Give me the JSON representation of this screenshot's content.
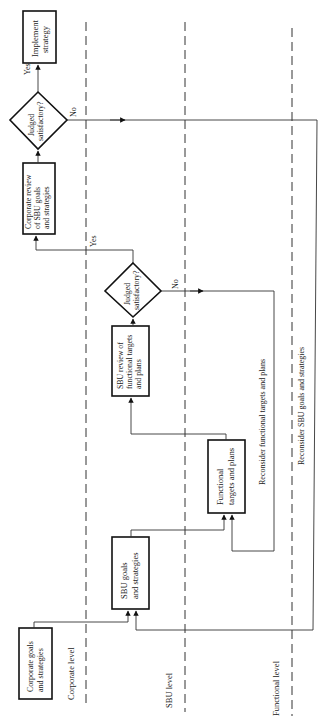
{
  "diagram": {
    "orientation": "rotated-90-ccw",
    "levels": [
      {
        "id": "corporate",
        "label": "Corporate level"
      },
      {
        "id": "sbu",
        "label": "SBU level"
      },
      {
        "id": "functional",
        "label": "Functional level"
      }
    ],
    "nodes": {
      "corporate_goals": {
        "line1": "Corporate goals",
        "line2": "and strategies"
      },
      "sbu_goals": {
        "line1": "SBU goals",
        "line2": "and strategies"
      },
      "functional_targets": {
        "line1": "Functional",
        "line2": "targets and plans"
      },
      "sbu_review": {
        "line1": "SBU review of",
        "line2": "functional targets",
        "line3": "and plans"
      },
      "sbu_decision": {
        "line1": "Judged",
        "line2": "satisfactory?"
      },
      "corporate_review": {
        "line1": "Corporate review",
        "line2": "of SBU goals",
        "line3": "and strategies"
      },
      "corporate_decision": {
        "line1": "Judged",
        "line2": "satisfactory?"
      },
      "implement": {
        "line1": "Implement",
        "line2": "strategy"
      }
    },
    "edge_labels": {
      "sbu_yes": "Yes",
      "sbu_no": "No",
      "corp_yes": "Yes",
      "corp_no": "No",
      "reconsider_functional": "Reconsider functional targets and plans",
      "reconsider_sbu": "Reconsider SBU goals and strategies"
    }
  }
}
